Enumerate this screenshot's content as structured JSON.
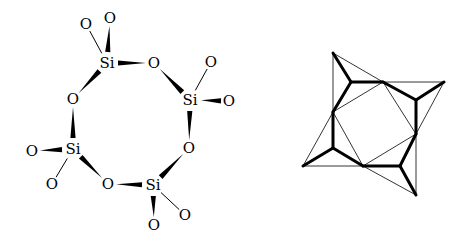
{
  "figure": {
    "left_panel": {
      "description": "Cyclotetrasilicate ring (Si4O12) structural formula",
      "atoms": [
        {
          "id": "Si1",
          "label": "Si",
          "x": 107,
          "y": 63
        },
        {
          "id": "Si2",
          "label": "Si",
          "x": 190,
          "y": 100
        },
        {
          "id": "Si3",
          "label": "Si",
          "x": 153,
          "y": 185
        },
        {
          "id": "Si4",
          "label": "Si",
          "x": 73,
          "y": 149
        },
        {
          "id": "Ob12",
          "label": "O",
          "x": 154,
          "y": 63
        },
        {
          "id": "Ob23",
          "label": "O",
          "x": 189,
          "y": 148
        },
        {
          "id": "Ob34",
          "label": "O",
          "x": 108,
          "y": 184
        },
        {
          "id": "Ob41",
          "label": "O",
          "x": 73,
          "y": 99
        },
        {
          "id": "O1a",
          "label": "O",
          "x": 86,
          "y": 24
        },
        {
          "id": "O1b",
          "label": "O",
          "x": 110,
          "y": 18
        },
        {
          "id": "O2a",
          "label": "O",
          "x": 211,
          "y": 62
        },
        {
          "id": "O2b",
          "label": "O",
          "x": 229,
          "y": 101
        },
        {
          "id": "O3a",
          "label": "O",
          "x": 185,
          "y": 215
        },
        {
          "id": "O3b",
          "label": "O",
          "x": 154,
          "y": 225
        },
        {
          "id": "O4a",
          "label": "O",
          "x": 32,
          "y": 151
        },
        {
          "id": "O4b",
          "label": "O",
          "x": 52,
          "y": 184
        }
      ],
      "bonds": [
        {
          "from": "Si1",
          "to": "O1a",
          "type": "line"
        },
        {
          "from": "Si1",
          "to": "O1b",
          "type": "wedge"
        },
        {
          "from": "Si1",
          "to": "Ob12",
          "type": "wedge"
        },
        {
          "from": "Si1",
          "to": "Ob41",
          "type": "wedge"
        },
        {
          "from": "Si2",
          "to": "Ob12",
          "type": "wedge"
        },
        {
          "from": "Si2",
          "to": "O2a",
          "type": "line"
        },
        {
          "from": "O2b",
          "to": "Si2",
          "type": "wedge"
        },
        {
          "from": "Si2",
          "to": "Ob23",
          "type": "wedge"
        },
        {
          "from": "Si3",
          "to": "Ob23",
          "type": "wedge"
        },
        {
          "from": "Si3",
          "to": "Ob34",
          "type": "wedge"
        },
        {
          "from": "Si3",
          "to": "O3a",
          "type": "line"
        },
        {
          "from": "Si3",
          "to": "O3b",
          "type": "wedge"
        },
        {
          "from": "Si4",
          "to": "Ob41",
          "type": "wedge"
        },
        {
          "from": "Si4",
          "to": "O4a",
          "type": "wedge"
        },
        {
          "from": "Si4",
          "to": "O4b",
          "type": "line"
        },
        {
          "from": "Si4",
          "to": "Ob34",
          "type": "wedge"
        }
      ]
    },
    "right_panel": {
      "description": "Polyhedral (tetrahedra) representation of the same ring",
      "points": {
        "A": [
          333,
          53
        ],
        "B": [
          351,
          82
        ],
        "C": [
          383,
          82
        ],
        "D": [
          444,
          82
        ],
        "E": [
          416,
          100
        ],
        "F": [
          416,
          134
        ],
        "G": [
          416,
          195
        ],
        "H": [
          400,
          166
        ],
        "I": [
          363,
          166
        ],
        "J": [
          303,
          166
        ],
        "K": [
          333,
          148
        ],
        "L": [
          333,
          112
        ]
      }
    }
  }
}
